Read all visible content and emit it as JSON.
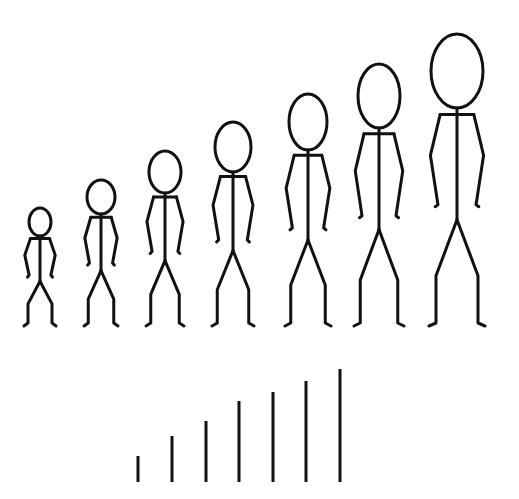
{
  "diagram": {
    "stroke_color": "#111111",
    "background": "#ffffff",
    "figures": [
      {
        "cx": 40,
        "head_top": 208,
        "head_rx": 11,
        "head_ry": 14,
        "feet_y": 323,
        "half_width": 16
      },
      {
        "cx": 101,
        "head_top": 180,
        "head_rx": 14,
        "head_ry": 17,
        "feet_y": 323,
        "half_width": 17
      },
      {
        "cx": 165,
        "head_top": 151,
        "head_rx": 16,
        "head_ry": 21,
        "feet_y": 323,
        "half_width": 19
      },
      {
        "cx": 233,
        "head_top": 122,
        "head_rx": 18,
        "head_ry": 25,
        "feet_y": 323,
        "half_width": 21
      },
      {
        "cx": 308,
        "head_top": 94,
        "head_rx": 19,
        "head_ry": 28,
        "feet_y": 323,
        "half_width": 23
      },
      {
        "cx": 379,
        "head_top": 64,
        "head_rx": 21,
        "head_ry": 32,
        "feet_y": 323,
        "half_width": 25
      },
      {
        "cx": 457,
        "head_top": 34,
        "head_rx": 26,
        "head_ry": 37,
        "feet_y": 323,
        "half_width": 28
      }
    ],
    "bars": [
      {
        "x": 138,
        "top": 456,
        "bottom": 482
      },
      {
        "x": 172,
        "top": 436,
        "bottom": 482
      },
      {
        "x": 206,
        "top": 421,
        "bottom": 482
      },
      {
        "x": 239,
        "top": 401,
        "bottom": 482
      },
      {
        "x": 273,
        "top": 392,
        "bottom": 482
      },
      {
        "x": 306,
        "top": 381,
        "bottom": 482
      },
      {
        "x": 340,
        "top": 369,
        "bottom": 482
      }
    ]
  }
}
